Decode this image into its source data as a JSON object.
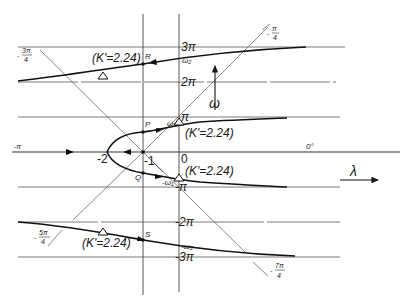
{
  "diagram": {
    "type": "root-locus",
    "axes": {
      "horizontal_label": "λ",
      "vertical_label": "ω",
      "origin_angle_label": "0°"
    },
    "real_axis_ticks": [
      "-2",
      "-1",
      "0"
    ],
    "imag_axis_ticks": [
      "3π",
      "2π",
      "π",
      "-π",
      "-2π",
      "-3π"
    ],
    "frequency_labels": {
      "w2_top": "ω₂",
      "w1_top": "ω₁",
      "w1_bottom": "-ω₁",
      "w2_bottom": "-ω₂"
    },
    "points": {
      "R": "R",
      "P": "P",
      "Q": "Q",
      "S": "S"
    },
    "gain_labels": {
      "upper_left": "(K'=2.24)",
      "upper_right": "(K'=2.24)",
      "lower_right": "(K'=2.24)",
      "lower_left": "(K'=2.24)"
    },
    "asymptote_angles": {
      "top_left": "-3π/4",
      "top_right": "-π/4",
      "bottom_left": "-5π/4",
      "bottom_right": "-7π/4",
      "left_axis": "-π"
    },
    "fractions": {
      "top_left": {
        "sign": "-",
        "num": "3π",
        "den": "4"
      },
      "top_right": {
        "sign": "-",
        "num": "π",
        "den": "4"
      },
      "bottom_left": {
        "sign": "-",
        "num": "5π",
        "den": "4"
      },
      "bottom_right": {
        "sign": "-",
        "num": "7π",
        "den": "4"
      }
    },
    "left_axis_label": "-π"
  }
}
